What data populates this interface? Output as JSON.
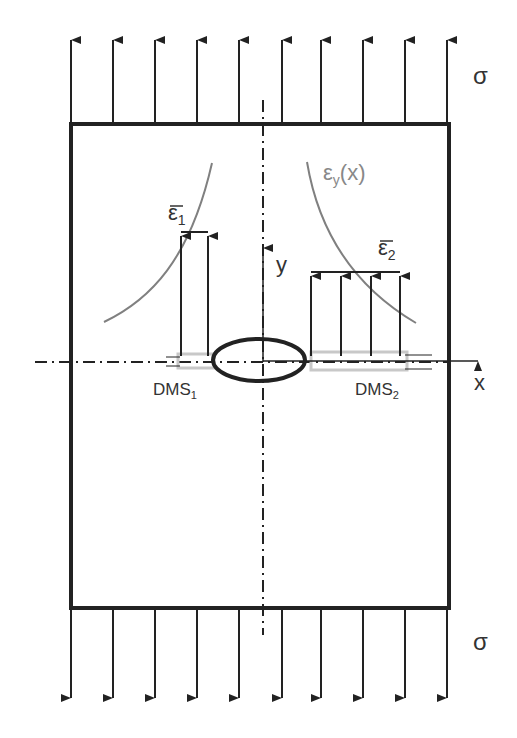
{
  "labels": {
    "sigma_top": "σ",
    "sigma_bottom": "σ",
    "eps_curve": "εy(x)",
    "eps_curve_main": "ε",
    "eps_curve_sub": "y",
    "eps_curve_arg": "(x)",
    "eps1_main": "ε",
    "eps1_sub": "1",
    "eps2_main": "ε",
    "eps2_sub": "2",
    "axis_x": "x",
    "axis_y": "y",
    "dms1_main": "DMS",
    "dms1_sub": "1",
    "dms2_main": "DMS",
    "dms2_sub": "2"
  },
  "colors": {
    "line": "#222222",
    "curve": "#808080",
    "gauge": "#c8c8c8"
  }
}
